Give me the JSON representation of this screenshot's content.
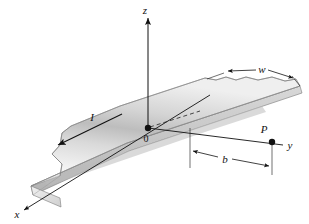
{
  "figure": {
    "kind": "physics-diagram-3d-current-strip",
    "background_color": "#ffffff",
    "line_color": "#111111",
    "strip": {
      "face_light_color": "#f2f2f2",
      "face_mid_color": "#d2d2d2",
      "face_dark_color": "#a8a8a8",
      "edge_color": "#6f6f6f",
      "side_color": "#c4c4c4",
      "end_color": "#e6e6e6"
    }
  },
  "labels": {
    "z_axis": "z",
    "x_axis": "x",
    "y_axis": "y",
    "origin": "0",
    "current": "I",
    "width": "w",
    "distance": "b",
    "point": "P"
  },
  "markers": {
    "origin_point_name": "origin-dot",
    "field_point_name": "field-point-dot"
  },
  "annotations": {
    "width_dimension": "w",
    "distance_dimension": "b"
  }
}
